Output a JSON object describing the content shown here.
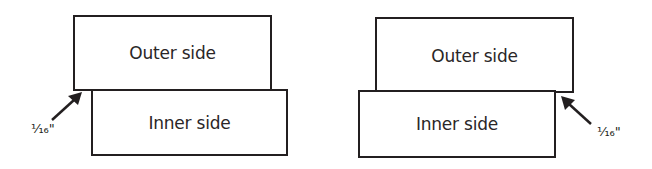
{
  "diagrams": [
    {
      "outer": {
        "label": "Outer side"
      },
      "inner": {
        "label": "Inner side"
      },
      "offset_label": "⅟₁₆\"",
      "offset_side": "left"
    },
    {
      "outer": {
        "label": "Outer side"
      },
      "inner": {
        "label": "Inner side"
      },
      "offset_label": "⅟₁₆\"",
      "offset_side": "right"
    }
  ],
  "colors": {
    "stroke": "#231f20",
    "background": "#ffffff"
  }
}
